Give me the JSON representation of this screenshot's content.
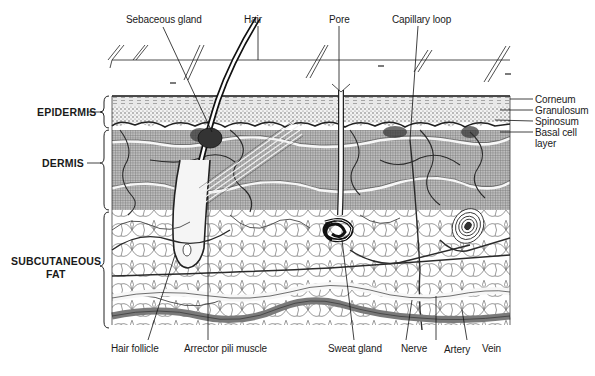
{
  "colors": {
    "ink": "#1a1a1a",
    "dermis_fill": "#8a8a8a",
    "epidermis_fill": "#d0d0d0",
    "fat_fill": "#ffffff",
    "vessel_fill": "#7a7a7a"
  },
  "labels": {
    "top": [
      {
        "id": "sebaceous-gland",
        "text": "Sebaceous gland"
      },
      {
        "id": "hair",
        "text": "Hair"
      },
      {
        "id": "pore",
        "text": "Pore"
      },
      {
        "id": "capillary-loop",
        "text": "Capillary loop"
      }
    ],
    "left": [
      {
        "id": "epidermis",
        "text": "EPIDERMIS"
      },
      {
        "id": "dermis",
        "text": "DERMIS"
      },
      {
        "id": "subcutaneous-fat-line1",
        "text": "SUBCUTANEOUS"
      },
      {
        "id": "subcutaneous-fat-line2",
        "text": "FAT"
      }
    ],
    "right": [
      {
        "id": "corneum",
        "text": "Corneum"
      },
      {
        "id": "granulosum",
        "text": "Granulosum"
      },
      {
        "id": "spinosum",
        "text": "Spinosum"
      },
      {
        "id": "basal-cell-line1",
        "text": "Basal cell"
      },
      {
        "id": "basal-cell-line2",
        "text": "layer"
      }
    ],
    "bottom": [
      {
        "id": "hair-follicle",
        "text": "Hair follicle"
      },
      {
        "id": "arrector-pili-muscle",
        "text": "Arrector pili muscle"
      },
      {
        "id": "sweat-gland",
        "text": "Sweat gland"
      },
      {
        "id": "nerve",
        "text": "Nerve"
      },
      {
        "id": "artery",
        "text": "Artery"
      },
      {
        "id": "vein",
        "text": "Vein"
      }
    ]
  }
}
